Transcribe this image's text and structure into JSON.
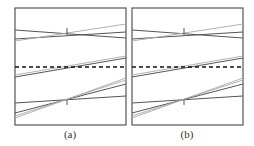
{
  "panels": [
    {
      "id": "a",
      "caption": "(a)"
    },
    {
      "id": "b",
      "caption": "(b)"
    }
  ],
  "colors": {
    "frame": "#555555",
    "dark_line": "#555555",
    "light_line": "#a8a8a8",
    "dashed_line": "#111111"
  }
}
